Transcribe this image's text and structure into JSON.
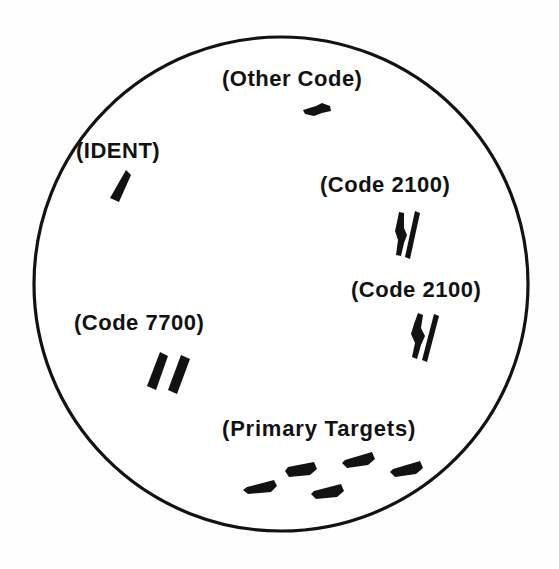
{
  "figure": {
    "kind": "radar-scope-ppi-display",
    "background_color": "#ffffff",
    "ink_color": "#121212"
  },
  "scope": {
    "shape": "circle",
    "center_x": 281,
    "center_y": 284,
    "radius": 247,
    "stroke_width": 3,
    "stroke_color": "#121212",
    "fill_color": "#ffffff"
  },
  "labels": {
    "other_code": "(Other Code)",
    "ident": "(IDENT)",
    "code_2100_upper": "(Code 2100)",
    "code_2100_lower": "(Code 2100)",
    "code_7700": "(Code 7700)",
    "primary_targets": "(Primary  Targets)"
  },
  "returns": [
    {
      "id": "other-code-return",
      "label": "(Other Code)",
      "type": "single-short-slash",
      "blips": 1,
      "x": 317,
      "y": 110
    },
    {
      "id": "ident-return",
      "label": "(IDENT)",
      "type": "wide-block",
      "blips": 1,
      "x": 121,
      "y": 186
    },
    {
      "id": "code-2100-upper-return",
      "label": "(Code 2100)",
      "type": "double-slash",
      "blips": 2,
      "x": 408,
      "y": 236
    },
    {
      "id": "code-2100-lower-return",
      "label": "(Code 2100)",
      "type": "double-slash",
      "blips": 2,
      "x": 424,
      "y": 338
    },
    {
      "id": "code-7700-return",
      "label": "(Code 7700)",
      "type": "double-wide-block",
      "blips": 2,
      "x": 170,
      "y": 372
    },
    {
      "id": "primary-targets-return",
      "label": "(Primary  Targets)",
      "type": "scattered-dashes",
      "blips": 5,
      "x": 335,
      "y": 478
    }
  ]
}
